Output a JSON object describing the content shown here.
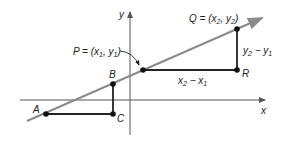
{
  "diagram": {
    "axes": {
      "x_label": "x",
      "y_label": "y"
    },
    "points": {
      "A": {
        "label": "A"
      },
      "B": {
        "label": "B"
      },
      "C": {
        "label": "C"
      },
      "P": {
        "label": "P = (x1, y1)",
        "name": "P",
        "x": "x",
        "x_sub": "1",
        "y": "y",
        "y_sub": "1"
      },
      "Q": {
        "label": "Q = (x2, y2)",
        "name": "Q",
        "x": "x",
        "x_sub": "2",
        "y": "y",
        "y_sub": "2"
      },
      "R": {
        "label": "R"
      }
    },
    "segments": {
      "rise": {
        "a": "y",
        "a_sub": "2",
        "op": " − ",
        "b": "y",
        "b_sub": "1"
      },
      "run": {
        "a": "x",
        "a_sub": "2",
        "op": " − ",
        "b": "x",
        "b_sub": "1"
      }
    },
    "colors": {
      "line": "#8a8a8a",
      "axes": "#555555",
      "segments": "#222222",
      "points": "#111111"
    }
  }
}
